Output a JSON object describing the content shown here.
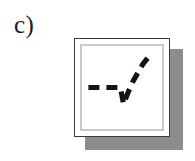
{
  "figure": {
    "label": "c)",
    "panel_id": "c",
    "colors": {
      "background": "#ffffff",
      "frame_border": "#3a3a3a",
      "inner_frame": "#c9c9c9",
      "shadow": "#8d8d8d",
      "curve": "#141414"
    }
  },
  "chart_data": {
    "type": "line",
    "title": "",
    "subtitle": "",
    "xlabel": "",
    "ylabel": "",
    "xlim": [
      0,
      100
    ],
    "ylim": [
      0,
      100
    ],
    "grid": false,
    "legend": null,
    "axis_ticks": {
      "x": [],
      "y": []
    },
    "annotations": [],
    "series": [
      {
        "name": "threshold-curve",
        "style": "dashed",
        "color": "#141414",
        "linewidth": 5.2,
        "dash_pattern": [
          11,
          7
        ],
        "x": [
          8,
          20,
          34,
          48,
          56,
          63,
          70,
          77,
          84
        ],
        "y": [
          50,
          50,
          50,
          50,
          42,
          62,
          70,
          78,
          86
        ],
        "points": [
          {
            "x": 8,
            "y": 50
          },
          {
            "x": 20,
            "y": 50
          },
          {
            "x": 34,
            "y": 50
          },
          {
            "x": 48,
            "y": 50
          },
          {
            "x": 52,
            "y": 30
          },
          {
            "x": 58,
            "y": 45
          },
          {
            "x": 64,
            "y": 58
          },
          {
            "x": 70,
            "y": 68
          },
          {
            "x": 76,
            "y": 78
          },
          {
            "x": 84,
            "y": 88
          }
        ]
      }
    ]
  }
}
